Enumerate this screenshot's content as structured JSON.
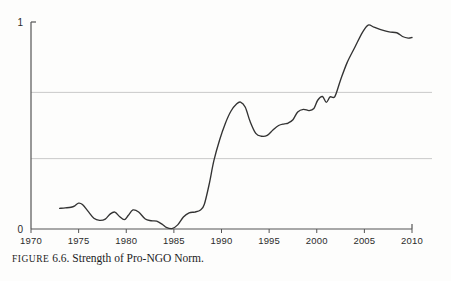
{
  "figure": {
    "caption_label": "FIGURE",
    "caption_number": "6.6.",
    "caption_title": "Strength of Pro-NGO Norm.",
    "caption_full": "FIGURE 6.6. Strength of Pro-NGO Norm."
  },
  "colors": {
    "line": "#333333",
    "axis": "#555555",
    "gridline": "#c9c9c9",
    "background": "#fdfdfc",
    "text": "#2b2b2b"
  },
  "chart_data": {
    "type": "line",
    "title": "Strength of Pro-NGO Norm.",
    "xlabel": "",
    "ylabel": "",
    "xlim": [
      1970,
      2010
    ],
    "ylim": [
      0,
      1
    ],
    "grid": true,
    "grid_orientation": "horizontal",
    "gridlines_y": [
      0.34,
      0.66
    ],
    "legend": "none",
    "xticks": [
      1970,
      1975,
      1980,
      1985,
      1990,
      1995,
      2000,
      2005,
      2010
    ],
    "xtick_labels": [
      "1970",
      "1975",
      "1980",
      "1985",
      "1990",
      "1995",
      "2000",
      "2005",
      "2010"
    ],
    "yticks": [
      0,
      1
    ],
    "ytick_labels": [
      "0",
      "1"
    ],
    "series": [
      {
        "name": "Strength of Pro-NGO Norm",
        "x": [
          1973.0,
          1973.6,
          1974.2,
          1974.6,
          1975.0,
          1975.4,
          1976.0,
          1976.6,
          1977.2,
          1977.8,
          1978.3,
          1978.8,
          1979.3,
          1979.8,
          1980.2,
          1980.7,
          1981.3,
          1982.0,
          1982.6,
          1983.2,
          1983.8,
          1984.2,
          1984.8,
          1985.4,
          1986.0,
          1986.6,
          1987.2,
          1987.8,
          1988.2,
          1988.7,
          1989.2,
          1989.8,
          1990.4,
          1991.0,
          1991.6,
          1992.0,
          1992.5,
          1993.0,
          1993.6,
          1994.2,
          1994.8,
          1995.4,
          1996.0,
          1996.6,
          1997.0,
          1997.5,
          1998.0,
          1998.6,
          1999.2,
          1999.7,
          2000.1,
          2000.6,
          2001.0,
          2001.4,
          2001.9,
          2002.5,
          2003.2,
          2004.0,
          2004.8,
          2005.4,
          2006.0,
          2006.8,
          2007.6,
          2008.4,
          2009.0,
          2009.6,
          2010.0
        ],
        "y": [
          0.1,
          0.102,
          0.105,
          0.112,
          0.125,
          0.118,
          0.085,
          0.052,
          0.042,
          0.048,
          0.072,
          0.082,
          0.06,
          0.045,
          0.065,
          0.092,
          0.082,
          0.048,
          0.04,
          0.038,
          0.022,
          0.008,
          0.002,
          0.02,
          0.058,
          0.078,
          0.082,
          0.092,
          0.12,
          0.215,
          0.33,
          0.43,
          0.51,
          0.57,
          0.605,
          0.613,
          0.588,
          0.52,
          0.462,
          0.448,
          0.452,
          0.478,
          0.5,
          0.508,
          0.512,
          0.528,
          0.565,
          0.578,
          0.572,
          0.582,
          0.622,
          0.64,
          0.612,
          0.638,
          0.64,
          0.72,
          0.805,
          0.878,
          0.95,
          0.985,
          0.975,
          0.962,
          0.952,
          0.948,
          0.93,
          0.922,
          0.925
        ]
      }
    ],
    "notes": {
      "start_year": 1973,
      "end_year": 2010,
      "minimum": {
        "year": 1984.8,
        "value": 0.0
      },
      "local_peak_1992": {
        "year": 1992.0,
        "value": 0.61
      },
      "local_trough_1994": {
        "year": 1994.2,
        "value": 0.45
      },
      "global_peak": {
        "year": 2005.4,
        "value": 0.99
      }
    }
  }
}
